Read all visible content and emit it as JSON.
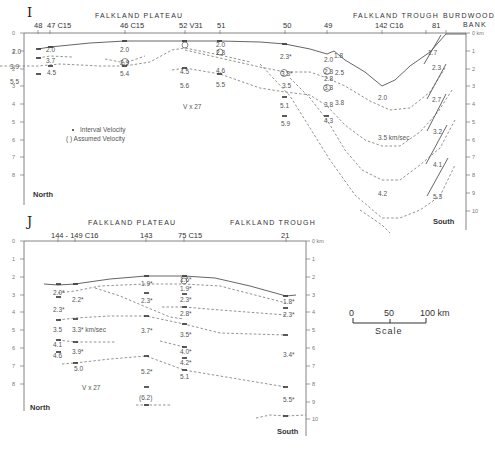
{
  "panel_I": {
    "label": "I",
    "regions": [
      {
        "name": "FALKLAND PLATEAU",
        "x": 125
      },
      {
        "name": "FALKLAND TROUGH",
        "x": 400
      },
      {
        "name": "BURDWOOD",
        "x": 462
      },
      {
        "name": "BANK",
        "x": 478
      }
    ],
    "stations": [
      "48",
      "47 C15",
      "46 C15",
      "52 V31",
      "51",
      "50",
      "49",
      "142 C16",
      "81"
    ],
    "depth_axis": {
      "unit": "km",
      "ticks": [
        "0 km",
        "1",
        "2",
        "3",
        "4",
        "5",
        "6",
        "7",
        "8",
        "9",
        "10"
      ]
    },
    "left_axis_ticks": [
      "0",
      "1",
      "2",
      "3",
      "4",
      "5",
      "6",
      "7",
      "8"
    ],
    "vertical_exaggeration": "V x 27",
    "legend": {
      "interval": "Interval Velocity",
      "assumed": "( ) Assumed Velocity"
    },
    "north_label": "North",
    "south_label": "South",
    "velocities": [
      {
        "v": "2.0",
        "x": 12,
        "y": 52
      },
      {
        "v": "2.0",
        "x": 45,
        "y": 50
      },
      {
        "v": "3.7",
        "x": 45,
        "y": 63
      },
      {
        "v": "3.9",
        "x": 8,
        "y": 68
      },
      {
        "v": "4.5",
        "x": 47,
        "y": 75
      },
      {
        "v": "5.5",
        "x": 8,
        "y": 84
      },
      {
        "v": "2.0",
        "x": 121,
        "y": 51
      },
      {
        "v": "2.9",
        "x": 121,
        "y": 64
      },
      {
        "v": "5.4",
        "x": 121,
        "y": 76
      },
      {
        "v": "4.5",
        "x": 181,
        "y": 73
      },
      {
        "v": "5.6",
        "x": 181,
        "y": 88
      },
      {
        "v": "2.0",
        "x": 218,
        "y": 46
      },
      {
        "v": "2.3",
        "x": 218,
        "y": 55
      },
      {
        "v": "4.6",
        "x": 218,
        "y": 73
      },
      {
        "v": "5.5",
        "x": 218,
        "y": 88
      },
      {
        "v": "V x 27",
        "x": 183,
        "y": 108
      },
      {
        "v": "2.3*",
        "x": 280,
        "y": 58
      },
      {
        "v": "3.3*",
        "x": 282,
        "y": 78
      },
      {
        "v": "3.5",
        "x": 284,
        "y": 88
      },
      {
        "v": "5.1",
        "x": 280,
        "y": 108
      },
      {
        "v": "5.9",
        "x": 282,
        "y": 125
      },
      {
        "v": "2.0",
        "x": 326,
        "y": 63
      },
      {
        "v": "1.8",
        "x": 334,
        "y": 59
      },
      {
        "v": "2.3",
        "x": 327,
        "y": 74
      },
      {
        "v": "2.5",
        "x": 337,
        "y": 75
      },
      {
        "v": "2.8",
        "x": 326,
        "y": 83
      },
      {
        "v": "3.3",
        "x": 326,
        "y": 92
      },
      {
        "v": "3.8",
        "x": 326,
        "y": 107
      },
      {
        "v": "3.8",
        "x": 336,
        "y": 105
      },
      {
        "v": "4.3",
        "x": 326,
        "y": 122
      },
      {
        "v": "2.0",
        "x": 378,
        "y": 99
      },
      {
        "v": "3.5  km/sec",
        "x": 378,
        "y": 141
      },
      {
        "v": "4.2",
        "x": 378,
        "y": 196
      },
      {
        "v": "1.7",
        "x": 427,
        "y": 55
      },
      {
        "v": "2.3",
        "x": 435,
        "y": 70
      },
      {
        "v": "2.7",
        "x": 435,
        "y": 102
      },
      {
        "v": "3.2",
        "x": 436,
        "y": 134
      },
      {
        "v": "4.1",
        "x": 436,
        "y": 167
      },
      {
        "v": "5.3",
        "x": 436,
        "y": 199
      }
    ]
  },
  "panel_J": {
    "label": "J",
    "regions": [
      {
        "name": "FALKLAND PLATEAU",
        "x": 125
      },
      {
        "name": "FALKLAND TROUGH",
        "x": 265
      }
    ],
    "stations": [
      "144 - 149 C16",
      "143",
      "75 C15",
      "21"
    ],
    "depth_axis": {
      "unit": "km",
      "ticks": [
        "0 km",
        "1",
        "2",
        "3",
        "4",
        "5",
        "6",
        "7",
        "8",
        "9",
        "10"
      ]
    },
    "left_axis_ticks": [
      "0",
      "1",
      "2",
      "3",
      "4",
      "5",
      "6",
      "7",
      "8"
    ],
    "vertical_exaggeration": "V x 27",
    "north_label": "North",
    "south_label": "South",
    "velocities": [
      {
        "v": "2.0*",
        "x": 55,
        "y": 293
      },
      {
        "v": "2.2*",
        "x": 73,
        "y": 301
      },
      {
        "v": "2.3*",
        "x": 55,
        "y": 311
      },
      {
        "v": "3.5",
        "x": 55,
        "y": 331
      },
      {
        "v": "3.3* km/sec",
        "x": 72,
        "y": 331
      },
      {
        "v": "4.1",
        "x": 55,
        "y": 345
      },
      {
        "v": "3.9*",
        "x": 74,
        "y": 352
      },
      {
        "v": "4.6",
        "x": 55,
        "y": 356
      },
      {
        "v": "5.0",
        "x": 74,
        "y": 370
      },
      {
        "v": "V x 27",
        "x": 82,
        "y": 390
      },
      {
        "v": "1.9*",
        "x": 143,
        "y": 285
      },
      {
        "v": "2.3*",
        "x": 143,
        "y": 302
      },
      {
        "v": "3.7*",
        "x": 143,
        "y": 331
      },
      {
        "v": "5.2*",
        "x": 143,
        "y": 373
      },
      {
        "v": "(6.2)",
        "x": 143,
        "y": 399
      },
      {
        "v": "1.6*",
        "x": 181,
        "y": 281
      },
      {
        "v": "1.9*",
        "x": 181,
        "y": 290
      },
      {
        "v": "2.3*",
        "x": 181,
        "y": 301
      },
      {
        "v": "2.8*",
        "x": 181,
        "y": 315
      },
      {
        "v": "3.5*",
        "x": 181,
        "y": 335
      },
      {
        "v": "4.0*",
        "x": 181,
        "y": 353
      },
      {
        "v": "4.2*",
        "x": 181,
        "y": 364
      },
      {
        "v": "5.1",
        "x": 181,
        "y": 378
      },
      {
        "v": "1.8*",
        "x": 286,
        "y": 303
      },
      {
        "v": "2.3*",
        "x": 286,
        "y": 316
      },
      {
        "v": "3.4*",
        "x": 286,
        "y": 356
      },
      {
        "v": "5.5*",
        "x": 286,
        "y": 401
      }
    ]
  },
  "scale_bar": {
    "ticks": [
      "0",
      "50",
      "100 km"
    ],
    "label": "Scale"
  }
}
